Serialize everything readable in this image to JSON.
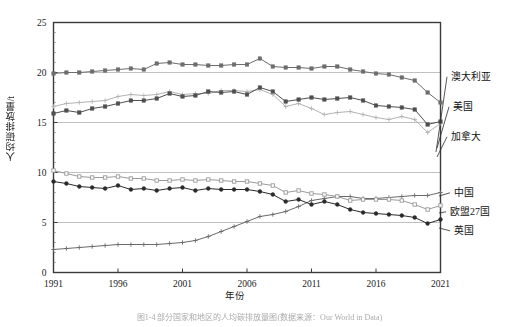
{
  "figure": {
    "caption": "图1-4  部分国家和地区的人均碳排放量图(数据来源：Our World in Data)",
    "ylabel": "人均碳排放量/t",
    "xlabel": "年份"
  },
  "chart_data": {
    "type": "line",
    "title": "",
    "xlabel": "年份",
    "ylabel": "人均碳排放量/t",
    "xlim": [
      1991,
      2021
    ],
    "ylim": [
      0,
      25
    ],
    "yticks": [
      0,
      5,
      10,
      15,
      20,
      25
    ],
    "xticks": [
      1991,
      1996,
      2001,
      2006,
      2011,
      2016,
      2021
    ],
    "grid": "horizontal-major",
    "legend_position": "right-outside",
    "x": [
      1991,
      1992,
      1993,
      1994,
      1995,
      1996,
      1997,
      1998,
      1999,
      2000,
      2001,
      2002,
      2003,
      2004,
      2005,
      2006,
      2007,
      2008,
      2009,
      2010,
      2011,
      2012,
      2013,
      2014,
      2015,
      2016,
      2017,
      2018,
      2019,
      2020,
      2021
    ],
    "series": [
      {
        "name": "澳大利亚",
        "marker": "square-filled",
        "color": "#6d6d6d",
        "values": [
          19.9,
          20.0,
          20.0,
          20.1,
          20.2,
          20.3,
          20.4,
          20.3,
          20.9,
          21.0,
          20.8,
          20.8,
          20.7,
          20.7,
          20.8,
          20.8,
          21.4,
          20.6,
          20.5,
          20.5,
          20.4,
          20.6,
          20.6,
          20.3,
          20.1,
          19.9,
          19.8,
          19.5,
          19.2,
          18.0,
          17.0
        ]
      },
      {
        "name": "美国",
        "marker": "plus-light",
        "color": "#b3b3b3",
        "values": [
          16.6,
          16.9,
          17.0,
          17.1,
          17.2,
          17.6,
          17.8,
          17.7,
          17.8,
          18.1,
          17.8,
          17.9,
          17.9,
          18.2,
          18.2,
          18.1,
          18.3,
          17.8,
          16.6,
          16.9,
          16.4,
          15.8,
          16.0,
          16.1,
          15.8,
          15.5,
          15.3,
          15.6,
          15.3,
          14.0,
          14.9
        ]
      },
      {
        "name": "加拿大",
        "marker": "square-filled",
        "color": "#4f4f4f",
        "values": [
          15.9,
          16.2,
          16.0,
          16.4,
          16.6,
          16.9,
          17.2,
          17.2,
          17.4,
          17.9,
          17.6,
          17.7,
          18.1,
          18.0,
          18.1,
          17.8,
          18.5,
          18.1,
          17.1,
          17.3,
          17.5,
          17.3,
          17.4,
          17.5,
          17.2,
          16.7,
          16.6,
          16.5,
          16.3,
          14.8,
          15.1
        ]
      },
      {
        "name": "中国",
        "marker": "plus",
        "color": "#6a6a6a",
        "values": [
          2.3,
          2.4,
          2.5,
          2.6,
          2.7,
          2.8,
          2.8,
          2.8,
          2.8,
          2.9,
          3.0,
          3.2,
          3.6,
          4.1,
          4.6,
          5.1,
          5.6,
          5.8,
          6.1,
          6.6,
          7.2,
          7.4,
          7.6,
          7.6,
          7.4,
          7.4,
          7.5,
          7.6,
          7.7,
          7.7,
          8.0
        ]
      },
      {
        "name": "欧盟27国",
        "marker": "square-open",
        "color": "#9a9a9a",
        "values": [
          10.2,
          9.9,
          9.6,
          9.5,
          9.5,
          9.6,
          9.4,
          9.4,
          9.2,
          9.2,
          9.3,
          9.2,
          9.3,
          9.2,
          9.1,
          9.1,
          8.9,
          8.7,
          8.0,
          8.2,
          7.9,
          7.8,
          7.6,
          7.2,
          7.3,
          7.3,
          7.3,
          7.2,
          6.8,
          6.3,
          6.7
        ]
      },
      {
        "name": "英国",
        "marker": "circle-filled",
        "color": "#2b2b2b",
        "values": [
          9.1,
          8.9,
          8.6,
          8.5,
          8.4,
          8.7,
          8.3,
          8.4,
          8.2,
          8.4,
          8.5,
          8.2,
          8.4,
          8.3,
          8.3,
          8.3,
          8.1,
          7.8,
          7.1,
          7.3,
          6.8,
          7.1,
          6.8,
          6.3,
          6.0,
          5.9,
          5.8,
          5.7,
          5.5,
          4.9,
          5.3
        ]
      }
    ],
    "legend_labels": [
      "澳大利亚",
      "美国",
      "加拿大",
      "中国",
      "欧盟27国",
      "英国"
    ]
  }
}
